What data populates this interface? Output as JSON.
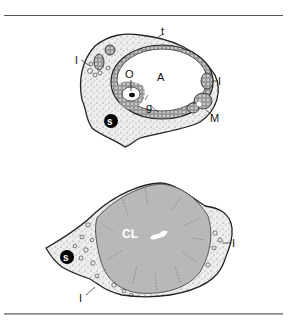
{
  "figure": {
    "top_panel": {
      "labels": {
        "theca": "t",
        "antrum": "A",
        "oocyte": "O",
        "granulosa": "g",
        "interstitial_left": "I",
        "interstitial_right": "I",
        "medullary": "M",
        "stroma_marker": "s"
      }
    },
    "bottom_panel": {
      "labels": {
        "corpus_luteum": "CL",
        "interstitial_right": "I",
        "interstitial_bottom": "I",
        "stroma_marker": "s"
      }
    }
  }
}
